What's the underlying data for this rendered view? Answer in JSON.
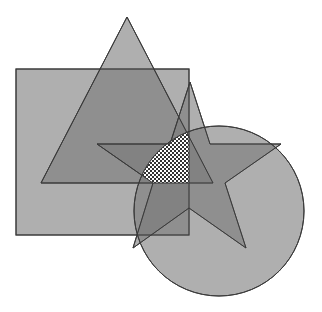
{
  "diagram": {
    "type": "overlapping-shapes",
    "background": "#ffffff",
    "fill_color": "#7a7a7a",
    "fill_opacity": 0.6,
    "stroke_color": "#3a3a3a",
    "shapes": [
      {
        "id": "square",
        "kind": "rect",
        "x": 16,
        "y": 69,
        "width": 173,
        "height": 166
      },
      {
        "id": "triangle",
        "kind": "polygon",
        "points": "127,17 213,183 41,183"
      },
      {
        "id": "star",
        "kind": "polygon",
        "points": "190,82 210,144 281,144 225,183 246,248 189,208 133,248 153,183 97,144 170,144"
      },
      {
        "id": "circle",
        "kind": "circle",
        "cx": 219,
        "cy": 211,
        "r": 85
      }
    ],
    "intersection": {
      "id": "all-shapes-intersection",
      "pattern": "checkerboard"
    }
  }
}
